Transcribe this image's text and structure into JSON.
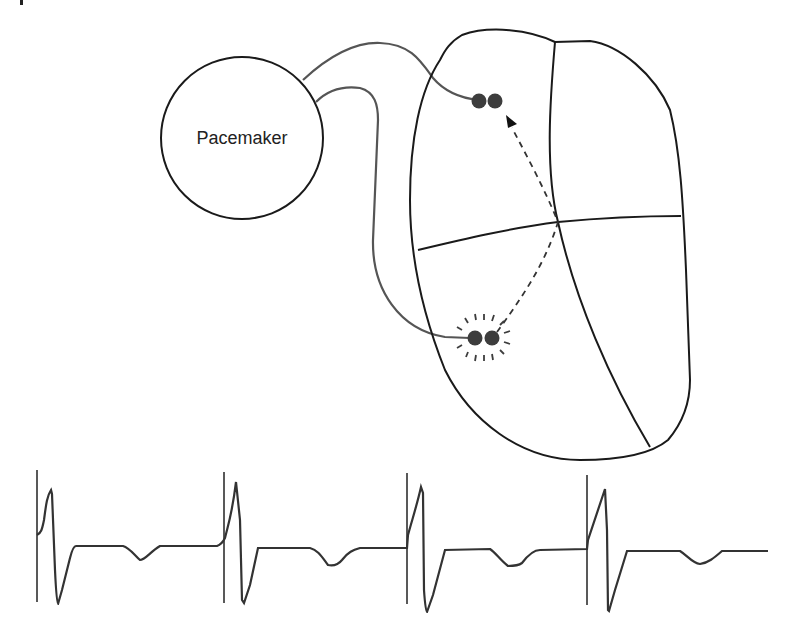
{
  "figure": {
    "type": "pacemaker-heart-diagram",
    "pacemaker": {
      "label": "Pacemaker"
    },
    "colors": {
      "outline": "#1a1a1a",
      "lead": "#555555",
      "electrode": "#3d3d3d",
      "ecg": "#333333",
      "background": "#ffffff"
    },
    "heart": {
      "chambers": 4,
      "upper_electrode": {
        "position": "right atrium",
        "state": "sensing"
      },
      "lower_electrode": {
        "position": "right ventricle",
        "state": "pacing"
      },
      "conduction": "dashed arrow from ventricle electrode retrograde to atrial electrode"
    },
    "ecg_strip": {
      "beats": 4,
      "pacing_spikes": 4,
      "description": "ventricular paced rhythm with pacing spikes preceding wide QRS complexes and inverted T waves"
    }
  }
}
